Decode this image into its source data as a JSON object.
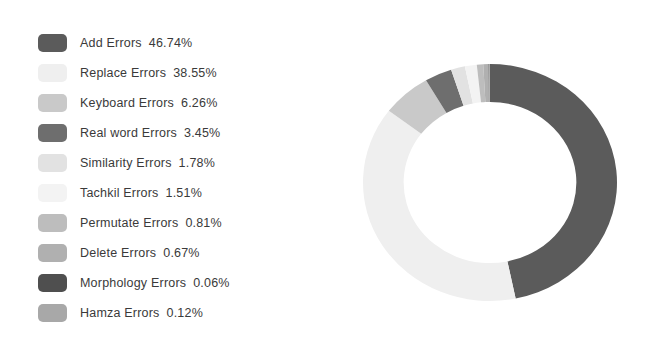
{
  "chart_data": {
    "type": "pie",
    "variant": "donut",
    "title": "",
    "subtitle": "",
    "xlabel": "",
    "ylabel": "",
    "grid": false,
    "legend_position": "left",
    "units": "percent",
    "start_angle_deg": 0,
    "direction": "clockwise",
    "inner_radius_ratio": 0.68,
    "categories": [
      "Add Errors",
      "Replace Errors",
      "Keyboard Errors",
      "Real word Errors",
      "Similarity Errors",
      "Tachkil Errors",
      "Permutate Errors",
      "Delete Errors",
      "Morphology Errors",
      "Hamza Errors"
    ],
    "values": [
      46.74,
      38.55,
      6.26,
      3.45,
      1.78,
      1.51,
      0.81,
      0.67,
      0.06,
      0.12
    ],
    "value_labels": [
      "46.74%",
      "38.55%",
      "6.26%",
      "3.45%",
      "1.78%",
      "1.51%",
      "0.81%",
      "0.67%",
      "0.06%",
      "0.12%"
    ],
    "colors": [
      "#5b5b5b",
      "#efefef",
      "#c9c9c9",
      "#6e6e6e",
      "#e2e2e2",
      "#f3f3f3",
      "#bdbdbd",
      "#b0b0b0",
      "#4f4f4f",
      "#a8a8a8"
    ]
  },
  "legend": {
    "items": [
      {
        "label": "Add Errors",
        "value": "46.74%",
        "color": "#5b5b5b",
        "swatch_name": "legend-swatch-add-errors"
      },
      {
        "label": "Replace Errors",
        "value": "38.55%",
        "color": "#efefef",
        "swatch_name": "legend-swatch-replace-errors"
      },
      {
        "label": "Keyboard Errors",
        "value": "6.26%",
        "color": "#c9c9c9",
        "swatch_name": "legend-swatch-keyboard-errors"
      },
      {
        "label": "Real word Errors",
        "value": "3.45%",
        "color": "#6e6e6e",
        "swatch_name": "legend-swatch-real-word-errors"
      },
      {
        "label": "Similarity Errors",
        "value": "1.78%",
        "color": "#e2e2e2",
        "swatch_name": "legend-swatch-similarity-errors"
      },
      {
        "label": "Tachkil Errors",
        "value": "1.51%",
        "color": "#f3f3f3",
        "swatch_name": "legend-swatch-tachkil-errors"
      },
      {
        "label": "Permutate Errors",
        "value": "0.81%",
        "color": "#bdbdbd",
        "swatch_name": "legend-swatch-permutate-errors"
      },
      {
        "label": "Delete Errors",
        "value": "0.67%",
        "color": "#b0b0b0",
        "swatch_name": "legend-swatch-delete-errors"
      },
      {
        "label": "Morphology Errors",
        "value": "0.06%",
        "color": "#4f4f4f",
        "swatch_name": "legend-swatch-morphology-errors"
      },
      {
        "label": "Hamza Errors",
        "value": "0.12%",
        "color": "#a8a8a8",
        "swatch_name": "legend-swatch-hamza-errors"
      }
    ]
  }
}
